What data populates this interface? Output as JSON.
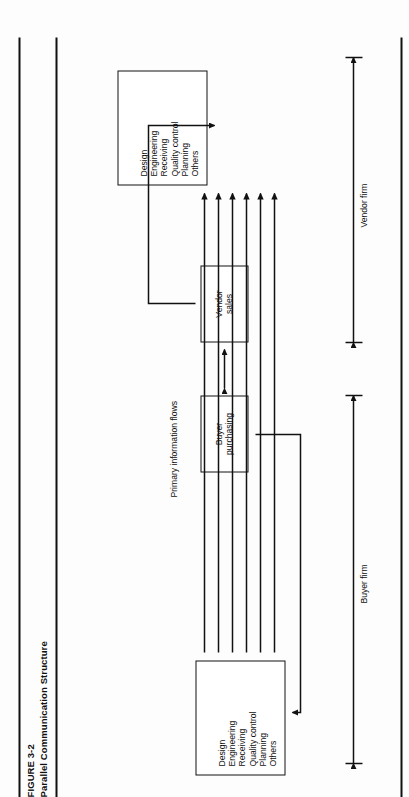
{
  "figure": {
    "number": "FIGURE 3-2",
    "title": "Parallel Communication Structure"
  },
  "boxes": {
    "buyer_departments": {
      "name": "buyer-departments-box",
      "items": [
        "Design",
        "Engineering",
        "Receiving",
        "Quality control",
        "Planning",
        "Others"
      ]
    },
    "vendor_departments": {
      "name": "vendor-departments-box",
      "items": [
        "Design",
        "Engineering",
        "Receiving",
        "Quality control",
        "Planning",
        "Others"
      ]
    },
    "buyer_purchasing": {
      "line1": "Buyer",
      "line2": "purchasing"
    },
    "vendor_sales": {
      "line1": "Vendor",
      "line2": "sales"
    }
  },
  "labels": {
    "primary_information_flows": "Primary information flows",
    "buyer_firm": "Buyer firm",
    "vendor_firm": "Vendor firm"
  },
  "style": {
    "ink": "#111111",
    "paper": "#fdfdfd"
  }
}
